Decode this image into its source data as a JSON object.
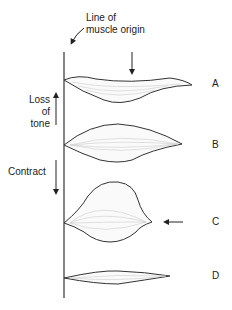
{
  "title_label": {
    "line1": "Line of",
    "line2": "muscle origin"
  },
  "side_labels": {
    "loss": {
      "line1": "Loss",
      "line2": "of",
      "line3": "tone"
    },
    "contract": "Contract"
  },
  "states": [
    {
      "id": "A",
      "label": "A",
      "description": "muscle with downward pressure arrow, loss of tone"
    },
    {
      "id": "B",
      "label": "B",
      "description": "normal resting muscle"
    },
    {
      "id": "C",
      "label": "C",
      "description": "contracted muscle with arrow pointing at insertion"
    },
    {
      "id": "D",
      "label": "D",
      "description": "thin elongated muscle"
    }
  ],
  "colors": {
    "line": "#333333",
    "fiber": "#bbbbbb"
  }
}
